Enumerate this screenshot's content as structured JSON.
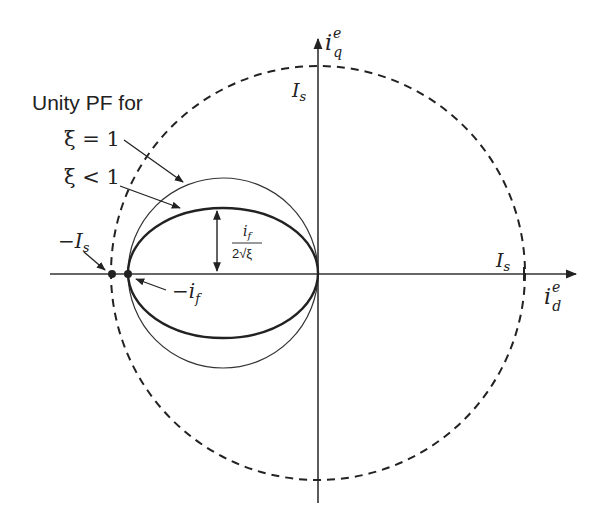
{
  "diagram": {
    "title_label": "Unity PF for",
    "curves": [
      {
        "name": "current-limit-circle",
        "style": "dashed",
        "label": "I_s"
      },
      {
        "name": "unity-pf-circle",
        "condition": "ξ = 1"
      },
      {
        "name": "unity-pf-ellipse",
        "condition": "ξ < 1"
      }
    ],
    "labels": {
      "xi_eq_1": "ξ = 1",
      "xi_lt_1": "ξ < 1",
      "neg_Is_minus": "−",
      "neg_Is_I": "I",
      "neg_Is_sub": "s",
      "neg_if_minus": "−",
      "neg_if_i": "i",
      "neg_if_sub": "f",
      "Is_top_I": "I",
      "Is_top_sub": "s",
      "Is_right_I": "I",
      "Is_right_sub": "s",
      "half_axis_num_i": "i",
      "half_axis_num_sub": "f",
      "half_axis_den": "2√ξ",
      "axis_q_i": "i",
      "axis_q_sup": "e",
      "axis_q_sub": "q",
      "axis_d_i": "i",
      "axis_d_sup": "e",
      "axis_d_sub": "d"
    },
    "axes": {
      "horizontal": "i_d^e",
      "vertical": "i_q^e"
    },
    "points": [
      "−I_s",
      "−i_f"
    ],
    "annotation": "i_f / (2√ξ)"
  }
}
